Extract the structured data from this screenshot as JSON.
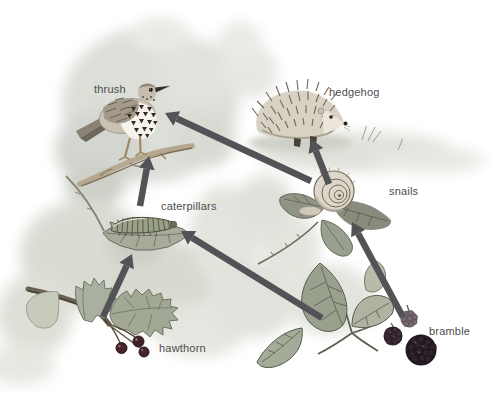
{
  "figure": {
    "type": "food-web-illustration",
    "background": "#ffffff"
  },
  "diagram": {
    "arrow_color": "#525257",
    "label_color": "#4d4d4d",
    "wash_color": "#dcded7",
    "nodes": [
      {
        "id": "thrush",
        "label": "thrush",
        "label_x": 94,
        "label_y": 84
      },
      {
        "id": "hedgehog",
        "label": "hedgehog",
        "label_x": 329,
        "label_y": 87
      },
      {
        "id": "caterpillars",
        "label": "caterpillars",
        "label_x": 161,
        "label_y": 201
      },
      {
        "id": "snails",
        "label": "snails",
        "label_x": 389,
        "label_y": 186
      },
      {
        "id": "hawthorn",
        "label": "hawthorn",
        "label_x": 159,
        "label_y": 343
      },
      {
        "id": "bramble",
        "label": "bramble",
        "label_x": 429,
        "label_y": 326
      }
    ],
    "edges": [
      {
        "from": "hawthorn",
        "to": "caterpillars",
        "x1": 103,
        "y1": 317,
        "x2": 132,
        "y2": 254
      },
      {
        "from": "caterpillars",
        "to": "thrush",
        "x1": 140,
        "y1": 206,
        "x2": 149,
        "y2": 156
      },
      {
        "from": "bramble",
        "to": "caterpillars",
        "x1": 322,
        "y1": 318,
        "x2": 181,
        "y2": 231
      },
      {
        "from": "bramble",
        "to": "snails",
        "x1": 403,
        "y1": 317,
        "x2": 352,
        "y2": 222
      },
      {
        "from": "snails",
        "to": "hedgehog",
        "x1": 329,
        "y1": 184,
        "x2": 311,
        "y2": 139
      },
      {
        "from": "snails",
        "to": "thrush",
        "x1": 311,
        "y1": 181,
        "x2": 165,
        "y2": 113
      }
    ]
  }
}
